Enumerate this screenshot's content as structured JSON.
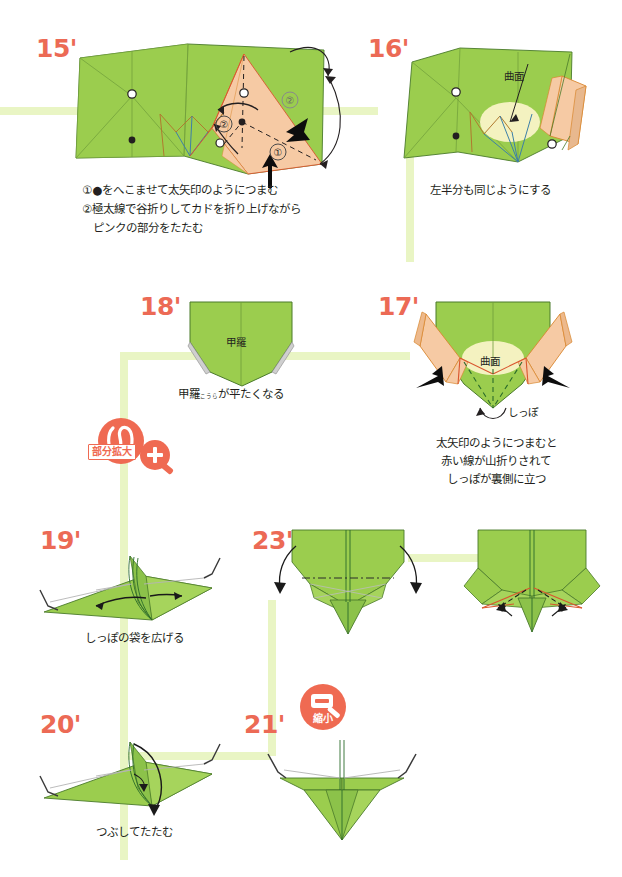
{
  "page": {
    "width": 622,
    "height": 877,
    "background": "#ffffff"
  },
  "colors": {
    "paper_green": "#9bcd4e",
    "paper_green_dark": "#7fb03c",
    "paper_green_shade": "#8cc24a",
    "paper_peach": "#f6caa4",
    "paper_peach_dark": "#e8a878",
    "curve_yellow": "#f4f2c0",
    "step_number": "#ec6a55",
    "badge_red": "#ef6a52",
    "flow_line": "#e9f5c4",
    "crease_red": "#d9562e",
    "crease_blue": "#3c7fa8",
    "crease_brown": "#b07a2e",
    "outline": "#4a7a2a",
    "text": "#231f20"
  },
  "steps": [
    {
      "id": "step-15",
      "number": "15'",
      "caption_lines": [
        "①●をへこませて太矢印のようにつまむ",
        "②極太線で谷折りしてカドを折り上げながら",
        "　ピンクの部分をたたむ"
      ],
      "labels": []
    },
    {
      "id": "step-16",
      "number": "16'",
      "caption_lines": [
        "左半分も同じようにする"
      ],
      "labels": [
        {
          "name": "curved-surface-label",
          "text": "曲面"
        }
      ]
    },
    {
      "id": "step-17",
      "number": "17'",
      "caption_lines": [
        "太矢印のようにつまむと",
        "赤い線が山折りされて",
        "しっぽが裏側に立つ"
      ],
      "labels": [
        {
          "name": "curved-surface-label",
          "text": "曲面"
        },
        {
          "name": "tail-label",
          "text": "しっぽ"
        }
      ]
    },
    {
      "id": "step-18",
      "number": "18'",
      "caption_ruby": {
        "base": "甲羅",
        "rt": "こうら",
        "rest": "が平たくなる"
      },
      "caption_plain": "甲羅が平たくなる",
      "labels": [
        {
          "name": "carapace-label",
          "text": "甲羅"
        }
      ]
    },
    {
      "id": "step-19",
      "number": "19'",
      "caption_lines": [
        "しっぽの袋を広げる"
      ],
      "labels": []
    },
    {
      "id": "step-20",
      "number": "20'",
      "caption_lines": [
        "つぶしてたたむ"
      ],
      "labels": []
    },
    {
      "id": "step-21",
      "number": "21'",
      "caption_lines": [],
      "labels": []
    },
    {
      "id": "step-22",
      "number": "22'",
      "caption_rich": {
        "line1_pre": "工程 ",
        "line1_step_a": "19'",
        "line1_mid": " 〜 ",
        "line1_step_b": "21'",
        "line1_post": " 同様に",
        "line2": "袋を広げてたたむ"
      },
      "labels": []
    },
    {
      "id": "step-23",
      "number": "23'",
      "caption_lines": [
        "赤いフチを",
        "合わせて折る"
      ],
      "labels": []
    }
  ],
  "badges": [
    {
      "id": "badge-zoom-in",
      "label": "部分拡大",
      "icon": "magnifier-plus-icon",
      "loop_icon": "loop-arrow-icon",
      "sign": "+"
    },
    {
      "id": "badge-zoom-out",
      "label": "縮小",
      "icon": "magnifier-minus-icon",
      "sign": "−"
    }
  ]
}
